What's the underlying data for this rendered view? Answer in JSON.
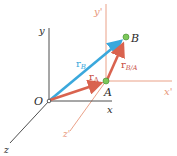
{
  "diagram": {
    "colors": {
      "fixed_axes": "#3a3a3a",
      "translating_axes": "#e8967a",
      "r_B": "#3aa8dc",
      "r_A": "#d9634f",
      "r_BA": "#d9634f",
      "point_fill": "#7cc85a",
      "point_stroke": "#3f8a2e",
      "label_dark": "#2a2a2a",
      "label_orange": "#e8967a",
      "label_blue": "#3aa8dc",
      "label_red": "#c84a3c"
    },
    "fixed_frame": {
      "origin_label": "O",
      "x_label": "x",
      "y_label": "y",
      "z_label": "z"
    },
    "translating_frame": {
      "x_label": "x'",
      "y_label": "y'",
      "z_label": "z'"
    },
    "points": [
      {
        "id": "A",
        "label": "A"
      },
      {
        "id": "B",
        "label": "B"
      }
    ],
    "vectors": [
      {
        "id": "r_B",
        "symbol": "r",
        "subscript": "B",
        "from": "O",
        "to": "B"
      },
      {
        "id": "r_A",
        "symbol": "r",
        "subscript": "A",
        "from": "O",
        "to": "A"
      },
      {
        "id": "r_BA",
        "symbol": "r",
        "subscript": "B/A",
        "from": "A",
        "to": "B"
      }
    ]
  }
}
